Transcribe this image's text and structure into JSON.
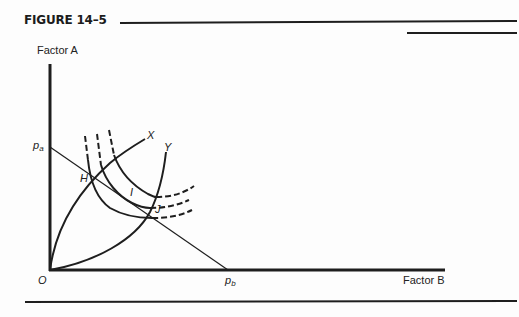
{
  "figure": {
    "title": "FIGURE 14–5",
    "y_axis_label": "Factor A",
    "x_axis_label": "Factor B",
    "origin_label": "O",
    "price_a_label": {
      "base": "p",
      "sub": "a"
    },
    "price_b_label": {
      "base": "p",
      "sub": "b"
    },
    "curve_labels": {
      "x": "X",
      "y": "Y"
    },
    "point_labels": {
      "h": "H",
      "i": "I",
      "j": "J"
    }
  },
  "colors": {
    "ink": "#1e1e1e",
    "background": "#fdfdfd"
  }
}
